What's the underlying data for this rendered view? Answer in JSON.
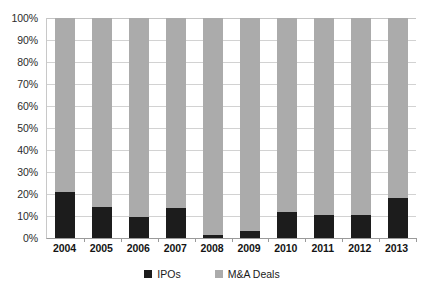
{
  "chart_data": {
    "type": "bar",
    "variant": "stacked-100-percent",
    "title": "",
    "subtitle": "",
    "xlabel": "",
    "ylabel": "",
    "categories": [
      "2004",
      "2005",
      "2006",
      "2007",
      "2008",
      "2009",
      "2010",
      "2011",
      "2012",
      "2013"
    ],
    "series": [
      {
        "name": "IPOs",
        "color": "#1c1c1c",
        "values": [
          21,
          14,
          9.5,
          13.5,
          1.5,
          3,
          12,
          10.5,
          10.5,
          18
        ]
      },
      {
        "name": "M&A Deals",
        "color": "#ababab",
        "values": [
          79,
          86,
          90.5,
          86.5,
          98.5,
          97,
          88,
          89.5,
          89.5,
          82
        ]
      }
    ],
    "ylim": [
      0,
      100
    ],
    "y_tick_values": [
      0,
      10,
      20,
      30,
      40,
      50,
      60,
      70,
      80,
      90,
      100
    ],
    "y_tick_labels": [
      "0%",
      "10%",
      "20%",
      "30%",
      "40%",
      "50%",
      "60%",
      "70%",
      "80%",
      "90%",
      "100%"
    ],
    "grid": true,
    "grid_axis": "y",
    "legend_position": "bottom",
    "legend_entries": [
      "IPOs",
      "M&A Deals"
    ],
    "annotations": []
  },
  "colors": {
    "ipos": "#1c1c1c",
    "ma_deals": "#ababab",
    "gridline": "#d2d2d2",
    "axis": "#9a9a9a",
    "background": "#ffffff",
    "text": "#1a1a1a"
  }
}
